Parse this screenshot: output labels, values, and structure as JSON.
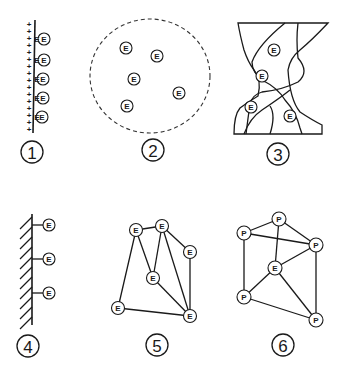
{
  "diagram": {
    "panels": [
      {
        "id": 1,
        "label": "1",
        "description": "Charged surface with adsorbed enzymes",
        "surface_charge": "+",
        "node_label": "E",
        "node_count": 5
      },
      {
        "id": 2,
        "label": "2",
        "description": "Enzymes entrapped within a dashed circular boundary",
        "node_label": "E",
        "node_count": 5
      },
      {
        "id": 3,
        "label": "3",
        "description": "Enzymes entrapped within intertwined fiber/gel network",
        "node_label": "E",
        "node_count": 4
      },
      {
        "id": 4,
        "label": "4",
        "description": "Enzymes covalently attached to solid support",
        "node_label": "E",
        "node_count": 3
      },
      {
        "id": 5,
        "label": "5",
        "description": "Enzymes cross-linked to each other",
        "node_label": "E",
        "node_count": 6
      },
      {
        "id": 6,
        "label": "6",
        "description": "Enzyme cross-linked with protein carriers",
        "node_labels": [
          "P",
          "P",
          "P",
          "E",
          "P",
          "P"
        ],
        "node_count": 6
      }
    ],
    "glyphs": {
      "enzyme": "E",
      "protein": "P",
      "positive_charge": "+"
    }
  }
}
